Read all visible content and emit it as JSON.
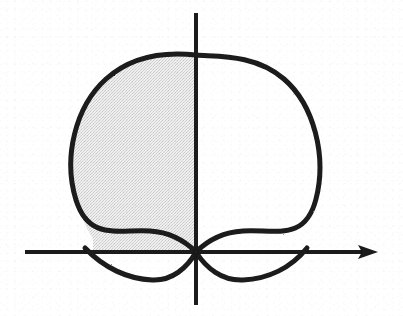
{
  "figure": {
    "background_color": "#ffffff",
    "ink_color": "#1a1a1a",
    "shade_color": "#e4e4e4",
    "width": 403,
    "height": 316
  },
  "axes": {
    "origin": {
      "x": 196,
      "y": 252
    },
    "x_axis": {
      "label": "x-axis",
      "start_x": 25,
      "end_x": 378,
      "y": 252,
      "stroke_width": 4,
      "arrow_head": "right",
      "arrow_tip_x": 378
    },
    "y_axis": {
      "label": "y-axis",
      "x": 196,
      "start_y": 13,
      "end_y": 305,
      "stroke_width": 4,
      "arrow_head": "none"
    }
  },
  "curve": {
    "name": "cardioid",
    "description": "Closed cardioid-like curve with a cusp at the origin, opening upward",
    "stroke_width": 5,
    "cusp": {
      "x": 196,
      "y": 252
    },
    "top": {
      "x": 193,
      "y": 55
    },
    "leftmost": {
      "x": 66,
      "y": 160
    },
    "rightmost": {
      "x": 325,
      "y": 163
    },
    "x_axis_crossings": [
      85,
      305
    ],
    "lower_lobe_bottom_y": 280,
    "lower_lobe_left_x": 140,
    "lower_lobe_right_x": 248,
    "path": "M 196 252 C 183 239 166 232 150 231 C 118 229 89 241 76 200 C 63 158 75 107 106 79 C 137 51 178 53 196 55 C 214 57 254 53 284 79 C 314 105 327 156 316 199 C 305 242 275 229 243 231 C 226 232 209 239 196 252 Z",
    "lower_left_lobe_path": "M 85 248 C 104 268 128 279 152 280 C 172 281 187 268 196 252",
    "lower_right_lobe_path": "M 196 252 C 206 268 222 281 243 280 C 268 279 291 268 307 248"
  },
  "shaded_region": {
    "name": "shaded-area",
    "description": "Interior of the cardioid in the second quadrant: left of the y-axis and above the x-axis",
    "fill": "#e4e4e4",
    "bounded_by": {
      "right": "y-axis",
      "bottom": "x-axis",
      "outer": "cardioid curve"
    },
    "path": "M 196 55 C 178 53 137 51 106 79 C 75 107 63 158 76 200 C 81 216 87 229 93 239 L 93 252 L 196 252 Z"
  }
}
